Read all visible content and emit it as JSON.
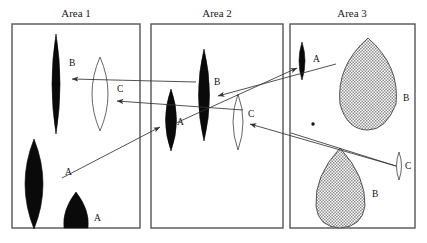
{
  "figure": {
    "type": "schematic-diagram",
    "background": "#ffffff",
    "stroke_color": "#333333"
  },
  "panels": [
    {
      "id": "area-1",
      "title": "Area 1",
      "box": {
        "x": 12,
        "y": 24,
        "w": 128,
        "h": 204
      },
      "shapes": [
        {
          "name": "lens-hatched-b",
          "label": "B",
          "fill": "hatched",
          "cx": 56,
          "cy": 84,
          "rx": 8,
          "ry": 50,
          "label_x": 69,
          "label_y": 66
        },
        {
          "name": "lens-open-c",
          "label": "C",
          "fill": "open",
          "cx": 100,
          "cy": 94,
          "rx": 16,
          "ry": 37,
          "label_x": 117,
          "label_y": 92
        },
        {
          "name": "lens-dark-a",
          "label": "A",
          "fill": "dark",
          "cx": 34,
          "cy": 184,
          "rx": 16,
          "ry": 45,
          "label_x": 65,
          "label_y": 175
        },
        {
          "name": "lens-dark-a2",
          "label": "A",
          "fill": "dark",
          "cx": 76,
          "cy": 216,
          "rx": 14,
          "ry": 25,
          "label_x": 94,
          "label_y": 221
        }
      ]
    },
    {
      "id": "area-2",
      "title": "Area 2",
      "box": {
        "x": 151,
        "y": 24,
        "w": 132,
        "h": 204
      },
      "shapes": [
        {
          "name": "lens-dark-a",
          "label": "A",
          "fill": "dark",
          "cx": 171,
          "cy": 120,
          "rx": 11,
          "ry": 31,
          "label_x": 177,
          "label_y": 125
        },
        {
          "name": "lens-hatched-b",
          "label": "B",
          "fill": "hatched",
          "cx": 204,
          "cy": 95,
          "rx": 11,
          "ry": 46,
          "label_x": 214,
          "label_y": 85
        },
        {
          "name": "lens-open-c",
          "label": "C",
          "fill": "open",
          "cx": 238,
          "cy": 122,
          "rx": 10,
          "ry": 28,
          "label_x": 248,
          "label_y": 117
        }
      ]
    },
    {
      "id": "area-3",
      "title": "Area 3",
      "box": {
        "x": 290,
        "y": 24,
        "w": 125,
        "h": 204
      },
      "shapes": [
        {
          "name": "lens-dark-a",
          "label": "A",
          "fill": "dark",
          "cx": 302,
          "cy": 61,
          "rx": 6,
          "ry": 19,
          "label_x": 313,
          "label_y": 62
        },
        {
          "name": "lens-hatched-b",
          "label": "B",
          "fill": "hatched",
          "cx": 368,
          "cy": 84,
          "rx": 32,
          "ry": 46,
          "label_x": 403,
          "label_y": 101
        },
        {
          "name": "lens-hatched-b2",
          "label": "B",
          "fill": "hatched",
          "cx": 340,
          "cy": 190,
          "rx": 25,
          "ry": 42,
          "label_x": 372,
          "label_y": 197
        },
        {
          "name": "lens-open-c",
          "label": "C",
          "fill": "open",
          "cx": 399,
          "cy": 166,
          "rx": 4,
          "ry": 14,
          "label_x": 405,
          "label_y": 169
        },
        {
          "name": "point-marker",
          "label": "",
          "fill": "dot",
          "cx": 313,
          "cy": 124,
          "rx": 1.6,
          "ry": 1.6,
          "label_x": 0,
          "label_y": 0
        }
      ]
    }
  ],
  "connections": [
    {
      "name": "ray-b-area2-to-area1",
      "label": "B",
      "from": [
        196,
        82
      ],
      "to": [
        69,
        79
      ],
      "arrow_at": "to"
    },
    {
      "name": "ray-c-area2-to-area1",
      "label": "C",
      "from": [
        240,
        110
      ],
      "to": [
        114,
        101
      ],
      "arrow_at": "to"
    },
    {
      "name": "ray-b-area3-to-area2",
      "label": "B",
      "from": [
        336,
        64
      ],
      "to": [
        215,
        96
      ],
      "arrow_at": "to"
    },
    {
      "name": "ray-c-area3-to-area2",
      "label": "C",
      "from": [
        396,
        166
      ],
      "to": [
        247,
        124
      ],
      "arrow_at": "to"
    },
    {
      "name": "ray-a-area1-to-area2",
      "label": "A",
      "from": [
        62,
        178
      ],
      "to": [
        163,
        126
      ],
      "arrow_at": "to"
    },
    {
      "name": "ray-a-area2-to-area3",
      "label": "A",
      "from": [
        178,
        122
      ],
      "to": [
        299,
        67
      ],
      "arrow_at": "to"
    },
    {
      "name": "ray-b-area3-lower",
      "label": "B",
      "from": [
        396,
        166
      ],
      "to": [
        291,
        133
      ],
      "arrow_at": "none"
    }
  ],
  "labels": {
    "A": "A",
    "B": "B",
    "C": "C"
  }
}
